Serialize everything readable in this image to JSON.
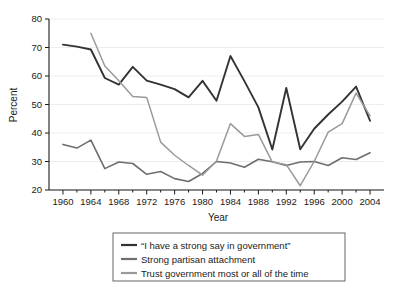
{
  "chart_data": {
    "type": "line",
    "title": "",
    "xlabel": "Year",
    "ylabel": "Percent",
    "xlim": [
      1958,
      2006
    ],
    "ylim": [
      20,
      80
    ],
    "grid": true,
    "legend_position": "bottom",
    "x_ticks": [
      1960,
      1964,
      1968,
      1972,
      1976,
      1980,
      1984,
      1988,
      1992,
      1996,
      2000,
      2004
    ],
    "x_minor_ticks": [
      1962,
      1966,
      1970,
      1974,
      1978,
      1982,
      1986,
      1990,
      1994,
      1998,
      2002
    ],
    "y_ticks": [
      20,
      30,
      40,
      50,
      60,
      70,
      80
    ],
    "colors": {
      "strong_say": "#333333",
      "partisan": "#6e6e6e",
      "trust": "#9a9a9a",
      "grid": "#e8e8e8",
      "axis": "#1a1a1a",
      "legend_border": "#555555",
      "background": "#ffffff"
    },
    "series": [
      {
        "name": "“I have a strong say in government”",
        "color": "#333333",
        "x": [
          1960,
          1962,
          1964,
          1966,
          1968,
          1970,
          1972,
          1974,
          1976,
          1978,
          1980,
          1982,
          1984,
          1986,
          1988,
          1990,
          1992,
          1994,
          1996,
          1998,
          2000,
          2002,
          2004
        ],
        "values": [
          71.0,
          70.3,
          69.3,
          59.3,
          57.0,
          63.2,
          58.4,
          57.0,
          55.4,
          52.5,
          58.3,
          51.3,
          67.0,
          58.2,
          49.0,
          34.2,
          55.8,
          34.3,
          41.5,
          46.5,
          51.0,
          56.3,
          44.3
        ]
      },
      {
        "name": "Strong partisan attachment",
        "color": "#6e6e6e",
        "x": [
          1960,
          1962,
          1964,
          1966,
          1968,
          1970,
          1972,
          1974,
          1976,
          1978,
          1980,
          1982,
          1984,
          1986,
          1988,
          1990,
          1992,
          1994,
          1996,
          1998,
          2000,
          2002,
          2004
        ],
        "values": [
          36.0,
          34.7,
          37.5,
          27.5,
          29.8,
          29.3,
          25.5,
          26.5,
          24.0,
          23.0,
          25.8,
          30.0,
          29.5,
          28.0,
          30.8,
          29.9,
          28.6,
          29.8,
          30.0,
          28.6,
          31.3,
          30.7,
          33.1
        ]
      },
      {
        "name": "Trust government most or all of the time",
        "color": "#9a9a9a",
        "x": [
          1964,
          1966,
          1968,
          1970,
          1972,
          1974,
          1976,
          1978,
          1980,
          1982,
          1984,
          1986,
          1988,
          1990,
          1992,
          1994,
          1996,
          1998,
          2000,
          2002,
          2004
        ],
        "values": [
          75.0,
          63.5,
          58.3,
          52.8,
          52.5,
          36.8,
          32.2,
          28.6,
          25.2,
          30.2,
          43.3,
          38.8,
          39.5,
          29.8,
          28.9,
          21.5,
          30.0,
          40.3,
          43.3,
          54.0,
          46.0
        ]
      }
    ]
  },
  "legend": {
    "items": [
      {
        "label": "“I have a strong say in government”",
        "color": "#333333"
      },
      {
        "label": "Strong partisan attachment",
        "color": "#6e6e6e"
      },
      {
        "label": "Trust government most or all of the time",
        "color": "#9a9a9a"
      }
    ]
  }
}
